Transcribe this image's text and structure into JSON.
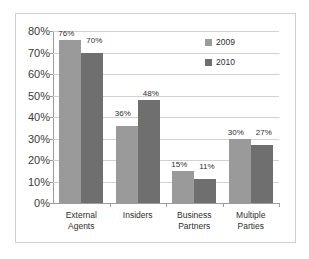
{
  "chart_data": {
    "type": "bar",
    "title": "",
    "xlabel": "",
    "ylabel": "",
    "ylim": [
      0,
      80
    ],
    "grid": true,
    "legend_position": "top-right",
    "categories": [
      "External Agents",
      "Insiders",
      "Business Partners",
      "Multiple Parties"
    ],
    "category_lines": [
      [
        "External",
        "Agents"
      ],
      [
        "Insiders",
        ""
      ],
      [
        "Business",
        "Partners"
      ],
      [
        "Multiple",
        "Parties"
      ]
    ],
    "ytick_labels": [
      "80%",
      "70%",
      "60%",
      "50%",
      "40%",
      "30%",
      "20%",
      "10%",
      "0%"
    ],
    "ytick_values": [
      80,
      70,
      60,
      50,
      40,
      30,
      20,
      10,
      0
    ],
    "series": [
      {
        "name": "2009",
        "color": "#9a9a9a",
        "values": [
          76,
          36,
          15,
          30
        ],
        "value_labels": [
          "76%",
          "36%",
          "15%",
          "30%"
        ]
      },
      {
        "name": "2010",
        "color": "#6f6f6f",
        "values": [
          70,
          48,
          11,
          27
        ],
        "value_labels": [
          "70%",
          "48%",
          "11%",
          "27%"
        ]
      }
    ]
  },
  "legend": {
    "items": [
      {
        "label": "2009",
        "color": "#9a9a9a"
      },
      {
        "label": "2010",
        "color": "#6f6f6f"
      }
    ]
  },
  "colors": {
    "frame_border": "#cfcfcf",
    "gridline": "#d2d2d2",
    "axis": "#9c9c9c",
    "text": "#2e2e2e",
    "background": "#ffffff"
  }
}
